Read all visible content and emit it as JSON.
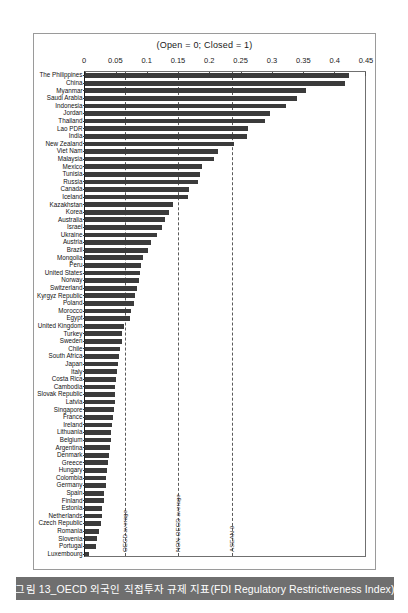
{
  "figure": {
    "caption": "그림 13_OECD 외국인 직접투자 규제 지표(FDI Regulatory Restrictiveness Index)",
    "caption_bar_color": "#6f6f6f",
    "bar_color": "#3b3b3b"
  },
  "chart_data": {
    "type": "bar",
    "orientation": "horizontal",
    "title": "(Open = 0; Closed = 1)",
    "xlabel": "",
    "ylabel": "",
    "xlim": [
      0,
      0.45
    ],
    "grid": false,
    "legend": "none",
    "ticks": [
      "0",
      "0.05",
      "0.1",
      "0.15",
      "0.2",
      "0.25",
      "0.3",
      "0.35",
      "0.4",
      "0.45"
    ],
    "tick_values": [
      0,
      0.05,
      0.1,
      0.15,
      0.2,
      0.25,
      0.3,
      0.35,
      0.4,
      0.45
    ],
    "reference_lines": [
      {
        "label": "OECD average",
        "value": 0.065
      },
      {
        "label": "NON-OECD average",
        "value": 0.15
      },
      {
        "label": "ASEAN 9",
        "value": 0.237
      }
    ],
    "categories": [
      "The Philippines",
      "China",
      "Myanmar",
      "Saudi Arabia",
      "Indonesia",
      "Jordan",
      "Thailand",
      "Lao PDR",
      "India",
      "New Zealand",
      "Viet Nam",
      "Malaysia",
      "Mexico",
      "Tunisia",
      "Russia",
      "Canada",
      "Iceland",
      "Kazakhstan",
      "Korea",
      "Australia",
      "Israel",
      "Ukraine",
      "Austria",
      "Brazil",
      "Mongolia",
      "Peru",
      "United States",
      "Norway",
      "Switzerland",
      "Kyrgyz Republic",
      "Poland",
      "Morocco",
      "Egypt",
      "United Kingdom",
      "Turkey",
      "Sweden",
      "Chile",
      "South Africa",
      "Japan",
      "Italy",
      "Costa Rica",
      "Cambodia",
      "Slovak Republic",
      "Latvia",
      "Singapore",
      "France",
      "Ireland",
      "Lithuania",
      "Belgium",
      "Argentina",
      "Denmark",
      "Greece",
      "Hungary",
      "Colombia",
      "Germany",
      "Spain",
      "Finland",
      "Estonia",
      "Netherlands",
      "Czech Republic",
      "Romania",
      "Slovenia",
      "Portugal",
      "Luxembourg"
    ],
    "values": [
      0.425,
      0.418,
      0.355,
      0.341,
      0.323,
      0.298,
      0.289,
      0.262,
      0.261,
      0.239,
      0.214,
      0.207,
      0.188,
      0.185,
      0.181,
      0.167,
      0.166,
      0.142,
      0.135,
      0.128,
      0.124,
      0.116,
      0.106,
      0.101,
      0.094,
      0.09,
      0.089,
      0.087,
      0.083,
      0.08,
      0.078,
      0.074,
      0.072,
      0.063,
      0.06,
      0.059,
      0.057,
      0.055,
      0.053,
      0.052,
      0.05,
      0.049,
      0.049,
      0.048,
      0.047,
      0.045,
      0.044,
      0.042,
      0.041,
      0.04,
      0.039,
      0.037,
      0.035,
      0.034,
      0.033,
      0.031,
      0.03,
      0.028,
      0.027,
      0.025,
      0.022,
      0.02,
      0.017,
      0.007
    ]
  }
}
